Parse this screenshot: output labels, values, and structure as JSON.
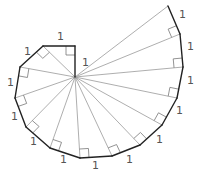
{
  "diagram": {
    "center": [
      75,
      77
    ],
    "outer_vertices": [
      [
        75,
        46
      ],
      [
        43,
        46
      ],
      [
        20,
        67
      ],
      [
        15,
        98
      ],
      [
        26,
        127
      ],
      [
        50,
        148
      ],
      [
        80,
        158
      ],
      [
        112,
        156
      ],
      [
        140,
        145
      ],
      [
        162,
        125
      ],
      [
        177,
        98
      ],
      [
        183,
        67
      ],
      [
        180,
        34
      ],
      [
        168,
        6
      ]
    ],
    "edge_labels": [
      {
        "text": "1",
        "x": 82,
        "y": 66
      },
      {
        "text": "1",
        "x": 57,
        "y": 40
      },
      {
        "text": "1",
        "x": 24,
        "y": 55
      },
      {
        "text": "1",
        "x": 7,
        "y": 86
      },
      {
        "text": "1",
        "x": 11,
        "y": 120
      },
      {
        "text": "1",
        "x": 30,
        "y": 145
      },
      {
        "text": "1",
        "x": 60,
        "y": 163
      },
      {
        "text": "1",
        "x": 92,
        "y": 169
      },
      {
        "text": "1",
        "x": 126,
        "y": 163
      },
      {
        "text": "1",
        "x": 156,
        "y": 143
      },
      {
        "text": "1",
        "x": 176,
        "y": 114
      },
      {
        "text": "1",
        "x": 187,
        "y": 84
      },
      {
        "text": "1",
        "x": 187,
        "y": 50
      },
      {
        "text": "1",
        "x": 179,
        "y": 18
      }
    ],
    "colors": {
      "outer_edge": "#222222",
      "spoke": "#999999",
      "right_angle": "#777777",
      "label": "#555555"
    }
  }
}
